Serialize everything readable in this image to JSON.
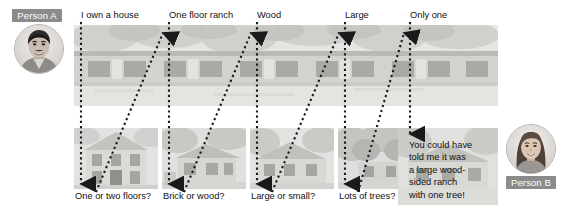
{
  "figure": {
    "title": "",
    "left_person": {
      "badge": "Person A",
      "avatar_icon": "male-avatar-photo"
    },
    "right_person": {
      "badge": "Person B",
      "avatar_icon": "female-avatar-photo"
    }
  },
  "colors": {
    "badge_background": "#8b8b8b",
    "badge_text": "#ffffff",
    "photo_background": "#dcdcdc",
    "arrow": "#1a1a1a",
    "page_background": "#ffffff",
    "text": "#111111"
  },
  "top_labels": [
    {
      "id": "own-a-house",
      "text": "I own a house"
    },
    {
      "id": "one-floor-ranch",
      "text": "One floor ranch"
    },
    {
      "id": "wood",
      "text": "Wood"
    },
    {
      "id": "large",
      "text": "Large"
    },
    {
      "id": "only-one",
      "text": "Only one"
    }
  ],
  "bottom_labels": [
    {
      "id": "one-or-two-floors",
      "text": "One or two floors?"
    },
    {
      "id": "brick-or-wood",
      "text": "Brick or wood?"
    },
    {
      "id": "large-or-small",
      "text": "Large or small?"
    },
    {
      "id": "lots-of-trees",
      "text": "Lots of trees?"
    }
  ],
  "final_statement": {
    "id": "final-statement",
    "text": "You could have\ntold me it was\na large wood-\nsided ranch\nwith one tree!"
  },
  "top_strip": {
    "id": "house-panorama",
    "icon": "house-photo-wide"
  },
  "bottom_panels": [
    {
      "id": "two-story-house",
      "icon": "house-photo"
    },
    {
      "id": "brick-house",
      "icon": "house-photo"
    },
    {
      "id": "large-house",
      "icon": "house-photo"
    },
    {
      "id": "house-with-trees",
      "icon": "house-photo"
    },
    {
      "id": "ranch-house",
      "icon": "house-photo"
    }
  ],
  "arrows": {
    "down_icon": "arrow-down",
    "up_icon": "arrow-up",
    "style": "dotted"
  }
}
